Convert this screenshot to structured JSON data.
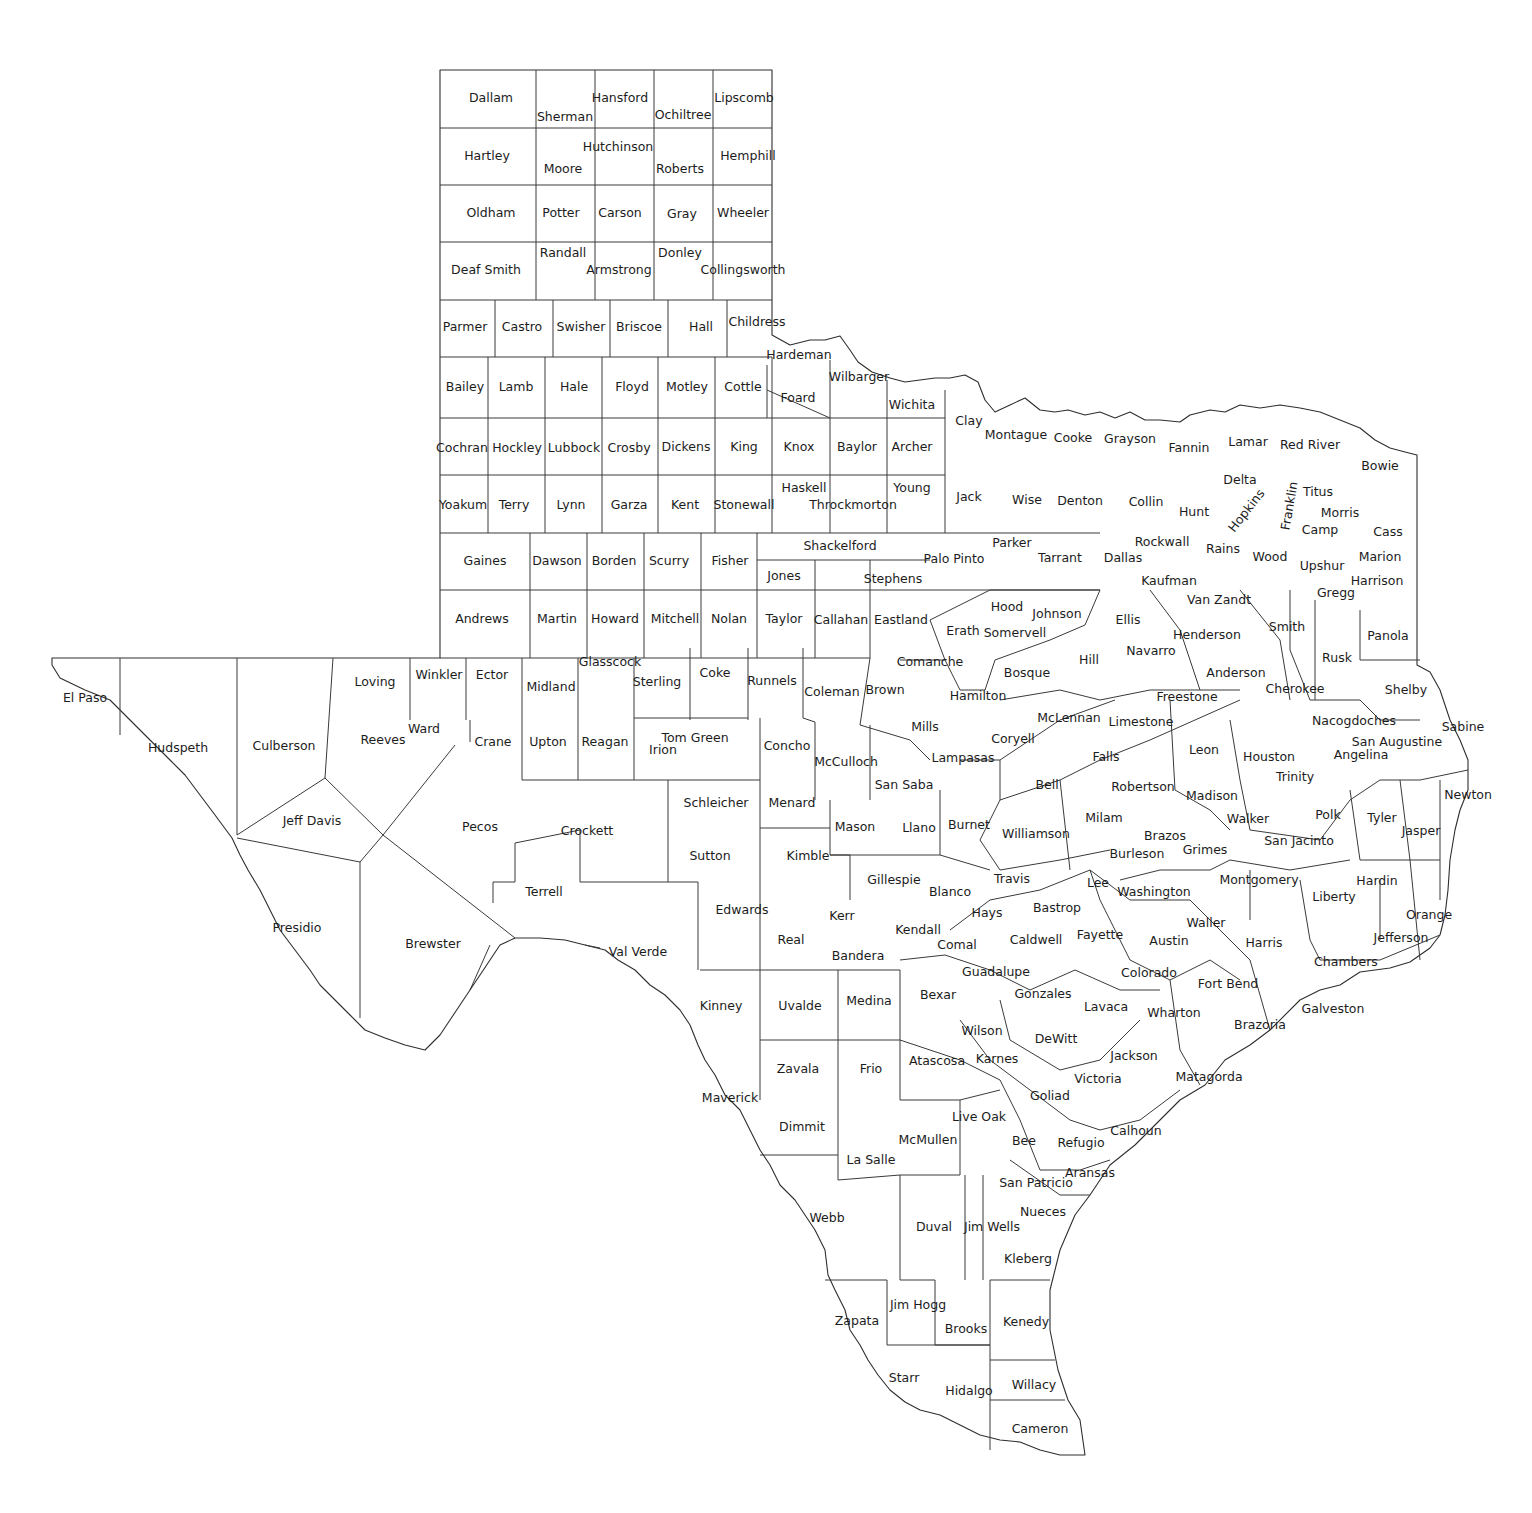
{
  "map": {
    "title": "Texas Counties",
    "stroke_color": "#3a3a3a",
    "label_color": "#1c1c1c",
    "background": "#ffffff"
  },
  "counties": [
    {
      "name": "Dallam",
      "x": 491,
      "y": 98
    },
    {
      "name": "Sherman",
      "x": 565,
      "y": 117
    },
    {
      "name": "Hansford",
      "x": 620,
      "y": 98
    },
    {
      "name": "Ochiltree",
      "x": 683,
      "y": 115
    },
    {
      "name": "Lipscomb",
      "x": 744,
      "y": 98
    },
    {
      "name": "Hartley",
      "x": 487,
      "y": 156
    },
    {
      "name": "Moore",
      "x": 563,
      "y": 169
    },
    {
      "name": "Hutchinson",
      "x": 618,
      "y": 147
    },
    {
      "name": "Roberts",
      "x": 680,
      "y": 169
    },
    {
      "name": "Hemphill",
      "x": 748,
      "y": 156
    },
    {
      "name": "Oldham",
      "x": 491,
      "y": 213
    },
    {
      "name": "Potter",
      "x": 561,
      "y": 213
    },
    {
      "name": "Carson",
      "x": 620,
      "y": 213
    },
    {
      "name": "Gray",
      "x": 682,
      "y": 214
    },
    {
      "name": "Wheeler",
      "x": 743,
      "y": 213
    },
    {
      "name": "Deaf Smith",
      "x": 486,
      "y": 270
    },
    {
      "name": "Randall",
      "x": 563,
      "y": 253
    },
    {
      "name": "Armstrong",
      "x": 619,
      "y": 270
    },
    {
      "name": "Donley",
      "x": 680,
      "y": 253
    },
    {
      "name": "Collingsworth",
      "x": 743,
      "y": 270
    },
    {
      "name": "Parmer",
      "x": 465,
      "y": 327
    },
    {
      "name": "Castro",
      "x": 522,
      "y": 327
    },
    {
      "name": "Swisher",
      "x": 581,
      "y": 327
    },
    {
      "name": "Briscoe",
      "x": 639,
      "y": 327
    },
    {
      "name": "Hall",
      "x": 701,
      "y": 327
    },
    {
      "name": "Childress",
      "x": 757,
      "y": 322
    },
    {
      "name": "Hardeman",
      "x": 799,
      "y": 355
    },
    {
      "name": "Wilbarger",
      "x": 859,
      "y": 377
    },
    {
      "name": "Foard",
      "x": 798,
      "y": 398
    },
    {
      "name": "Wichita",
      "x": 912,
      "y": 405
    },
    {
      "name": "Bailey",
      "x": 465,
      "y": 387
    },
    {
      "name": "Lamb",
      "x": 516,
      "y": 387
    },
    {
      "name": "Hale",
      "x": 574,
      "y": 387
    },
    {
      "name": "Floyd",
      "x": 632,
      "y": 387
    },
    {
      "name": "Motley",
      "x": 687,
      "y": 387
    },
    {
      "name": "Cottle",
      "x": 743,
      "y": 387
    },
    {
      "name": "Cochran",
      "x": 462,
      "y": 448
    },
    {
      "name": "Hockley",
      "x": 517,
      "y": 448
    },
    {
      "name": "Lubbock",
      "x": 574,
      "y": 448
    },
    {
      "name": "Crosby",
      "x": 629,
      "y": 448
    },
    {
      "name": "Dickens",
      "x": 686,
      "y": 447
    },
    {
      "name": "King",
      "x": 744,
      "y": 447
    },
    {
      "name": "Knox",
      "x": 799,
      "y": 447
    },
    {
      "name": "Baylor",
      "x": 857,
      "y": 447
    },
    {
      "name": "Archer",
      "x": 912,
      "y": 447
    },
    {
      "name": "Clay",
      "x": 969,
      "y": 421
    },
    {
      "name": "Montague",
      "x": 1016,
      "y": 435
    },
    {
      "name": "Cooke",
      "x": 1073,
      "y": 438
    },
    {
      "name": "Grayson",
      "x": 1130,
      "y": 439
    },
    {
      "name": "Fannin",
      "x": 1189,
      "y": 448
    },
    {
      "name": "Lamar",
      "x": 1248,
      "y": 442
    },
    {
      "name": "Red River",
      "x": 1310,
      "y": 445
    },
    {
      "name": "Bowie",
      "x": 1380,
      "y": 466
    },
    {
      "name": "Yoakum",
      "x": 463,
      "y": 505
    },
    {
      "name": "Terry",
      "x": 514,
      "y": 505
    },
    {
      "name": "Lynn",
      "x": 571,
      "y": 505
    },
    {
      "name": "Garza",
      "x": 629,
      "y": 505
    },
    {
      "name": "Kent",
      "x": 685,
      "y": 505
    },
    {
      "name": "Stonewall",
      "x": 744,
      "y": 505
    },
    {
      "name": "Haskell",
      "x": 804,
      "y": 488
    },
    {
      "name": "Throckmorton",
      "x": 853,
      "y": 505
    },
    {
      "name": "Young",
      "x": 912,
      "y": 488
    },
    {
      "name": "Jack",
      "x": 969,
      "y": 497
    },
    {
      "name": "Wise",
      "x": 1027,
      "y": 500
    },
    {
      "name": "Denton",
      "x": 1080,
      "y": 501
    },
    {
      "name": "Collin",
      "x": 1146,
      "y": 502
    },
    {
      "name": "Hunt",
      "x": 1194,
      "y": 512
    },
    {
      "name": "Delta",
      "x": 1240,
      "y": 480
    },
    {
      "name": "Titus",
      "x": 1318,
      "y": 492
    },
    {
      "name": "Morris",
      "x": 1340,
      "y": 513
    },
    {
      "name": "Camp",
      "x": 1320,
      "y": 530
    },
    {
      "name": "Cass",
      "x": 1388,
      "y": 532
    },
    {
      "name": "Gaines",
      "x": 485,
      "y": 561
    },
    {
      "name": "Dawson",
      "x": 557,
      "y": 561
    },
    {
      "name": "Borden",
      "x": 614,
      "y": 561
    },
    {
      "name": "Scurry",
      "x": 669,
      "y": 561
    },
    {
      "name": "Fisher",
      "x": 730,
      "y": 561
    },
    {
      "name": "Jones",
      "x": 784,
      "y": 576
    },
    {
      "name": "Shackelford",
      "x": 840,
      "y": 546
    },
    {
      "name": "Stephens",
      "x": 893,
      "y": 579
    },
    {
      "name": "Palo Pinto",
      "x": 954,
      "y": 559
    },
    {
      "name": "Parker",
      "x": 1012,
      "y": 543
    },
    {
      "name": "Tarrant",
      "x": 1060,
      "y": 558
    },
    {
      "name": "Dallas",
      "x": 1123,
      "y": 558
    },
    {
      "name": "Rockwall",
      "x": 1162,
      "y": 542
    },
    {
      "name": "Rains",
      "x": 1223,
      "y": 549
    },
    {
      "name": "Wood",
      "x": 1270,
      "y": 557
    },
    {
      "name": "Upshur",
      "x": 1322,
      "y": 566
    },
    {
      "name": "Marion",
      "x": 1380,
      "y": 557
    },
    {
      "name": "Kaufman",
      "x": 1169,
      "y": 581
    },
    {
      "name": "Van Zandt",
      "x": 1219,
      "y": 600
    },
    {
      "name": "Gregg",
      "x": 1336,
      "y": 593
    },
    {
      "name": "Harrison",
      "x": 1377,
      "y": 581
    },
    {
      "name": "Andrews",
      "x": 482,
      "y": 619
    },
    {
      "name": "Martin",
      "x": 557,
      "y": 619
    },
    {
      "name": "Howard",
      "x": 615,
      "y": 619
    },
    {
      "name": "Mitchell",
      "x": 675,
      "y": 619
    },
    {
      "name": "Nolan",
      "x": 729,
      "y": 619
    },
    {
      "name": "Taylor",
      "x": 784,
      "y": 619
    },
    {
      "name": "Callahan",
      "x": 841,
      "y": 620
    },
    {
      "name": "Eastland",
      "x": 901,
      "y": 620
    },
    {
      "name": "Erath",
      "x": 963,
      "y": 631
    },
    {
      "name": "Hood",
      "x": 1007,
      "y": 607
    },
    {
      "name": "Somervell",
      "x": 1015,
      "y": 633
    },
    {
      "name": "Johnson",
      "x": 1057,
      "y": 614
    },
    {
      "name": "Ellis",
      "x": 1128,
      "y": 620
    },
    {
      "name": "Henderson",
      "x": 1207,
      "y": 635
    },
    {
      "name": "Smith",
      "x": 1287,
      "y": 627
    },
    {
      "name": "Panola",
      "x": 1388,
      "y": 636
    },
    {
      "name": "El Paso",
      "x": 85,
      "y": 698
    },
    {
      "name": "Hudspeth",
      "x": 178,
      "y": 748
    },
    {
      "name": "Culberson",
      "x": 284,
      "y": 746
    },
    {
      "name": "Loving",
      "x": 375,
      "y": 682
    },
    {
      "name": "Winkler",
      "x": 439,
      "y": 675
    },
    {
      "name": "Ector",
      "x": 492,
      "y": 675
    },
    {
      "name": "Midland",
      "x": 551,
      "y": 687
    },
    {
      "name": "Glasscock",
      "x": 610,
      "y": 662
    },
    {
      "name": "Sterling",
      "x": 657,
      "y": 682
    },
    {
      "name": "Coke",
      "x": 715,
      "y": 673
    },
    {
      "name": "Runnels",
      "x": 772,
      "y": 681
    },
    {
      "name": "Coleman",
      "x": 832,
      "y": 692
    },
    {
      "name": "Brown",
      "x": 885,
      "y": 690
    },
    {
      "name": "Comanche",
      "x": 930,
      "y": 662
    },
    {
      "name": "Bosque",
      "x": 1027,
      "y": 673
    },
    {
      "name": "Hill",
      "x": 1089,
      "y": 660
    },
    {
      "name": "Navarro",
      "x": 1151,
      "y": 651
    },
    {
      "name": "Anderson",
      "x": 1236,
      "y": 673
    },
    {
      "name": "Cherokee",
      "x": 1295,
      "y": 689
    },
    {
      "name": "Rusk",
      "x": 1337,
      "y": 658
    },
    {
      "name": "Shelby",
      "x": 1406,
      "y": 690
    },
    {
      "name": "Reeves",
      "x": 383,
      "y": 740
    },
    {
      "name": "Ward",
      "x": 424,
      "y": 729
    },
    {
      "name": "Crane",
      "x": 493,
      "y": 742
    },
    {
      "name": "Upton",
      "x": 548,
      "y": 742
    },
    {
      "name": "Reagan",
      "x": 605,
      "y": 742
    },
    {
      "name": "Irion",
      "x": 663,
      "y": 750
    },
    {
      "name": "Tom Green",
      "x": 695,
      "y": 738
    },
    {
      "name": "Concho",
      "x": 787,
      "y": 746
    },
    {
      "name": "McCulloch",
      "x": 846,
      "y": 762
    },
    {
      "name": "Mills",
      "x": 925,
      "y": 727
    },
    {
      "name": "Hamilton",
      "x": 978,
      "y": 696
    },
    {
      "name": "Coryell",
      "x": 1013,
      "y": 739
    },
    {
      "name": "McLennan",
      "x": 1069,
      "y": 718
    },
    {
      "name": "Limestone",
      "x": 1141,
      "y": 722
    },
    {
      "name": "Freestone",
      "x": 1187,
      "y": 697
    },
    {
      "name": "Leon",
      "x": 1204,
      "y": 750
    },
    {
      "name": "Houston",
      "x": 1269,
      "y": 757
    },
    {
      "name": "Trinity",
      "x": 1295,
      "y": 777
    },
    {
      "name": "Nacogdoches",
      "x": 1354,
      "y": 721
    },
    {
      "name": "San Augustine",
      "x": 1397,
      "y": 742
    },
    {
      "name": "Angelina",
      "x": 1361,
      "y": 755
    },
    {
      "name": "Sabine",
      "x": 1463,
      "y": 727
    },
    {
      "name": "Lampasas",
      "x": 963,
      "y": 758
    },
    {
      "name": "Bell",
      "x": 1047,
      "y": 785
    },
    {
      "name": "Falls",
      "x": 1106,
      "y": 757
    },
    {
      "name": "Robertson",
      "x": 1143,
      "y": 787
    },
    {
      "name": "Madison",
      "x": 1212,
      "y": 796
    },
    {
      "name": "Polk",
      "x": 1328,
      "y": 815
    },
    {
      "name": "Tyler",
      "x": 1382,
      "y": 818
    },
    {
      "name": "Jasper",
      "x": 1421,
      "y": 831
    },
    {
      "name": "Newton",
      "x": 1468,
      "y": 795
    },
    {
      "name": "Jeff Davis",
      "x": 312,
      "y": 821
    },
    {
      "name": "Pecos",
      "x": 480,
      "y": 827
    },
    {
      "name": "Crockett",
      "x": 587,
      "y": 831
    },
    {
      "name": "Schleicher",
      "x": 716,
      "y": 803
    },
    {
      "name": "Menard",
      "x": 792,
      "y": 803
    },
    {
      "name": "San Saba",
      "x": 904,
      "y": 785
    },
    {
      "name": "Mason",
      "x": 855,
      "y": 827
    },
    {
      "name": "Llano",
      "x": 919,
      "y": 828
    },
    {
      "name": "Burnet",
      "x": 969,
      "y": 825
    },
    {
      "name": "Williamson",
      "x": 1036,
      "y": 834
    },
    {
      "name": "Milam",
      "x": 1104,
      "y": 818
    },
    {
      "name": "Brazos",
      "x": 1165,
      "y": 836
    },
    {
      "name": "Walker",
      "x": 1248,
      "y": 819
    },
    {
      "name": "San Jacinto",
      "x": 1299,
      "y": 841
    },
    {
      "name": "Grimes",
      "x": 1205,
      "y": 850
    },
    {
      "name": "Burleson",
      "x": 1137,
      "y": 854
    },
    {
      "name": "Sutton",
      "x": 710,
      "y": 856
    },
    {
      "name": "Kimble",
      "x": 808,
      "y": 856
    },
    {
      "name": "Gillespie",
      "x": 894,
      "y": 880
    },
    {
      "name": "Blanco",
      "x": 950,
      "y": 892
    },
    {
      "name": "Travis",
      "x": 1012,
      "y": 879
    },
    {
      "name": "Lee",
      "x": 1098,
      "y": 883
    },
    {
      "name": "Washington",
      "x": 1154,
      "y": 892
    },
    {
      "name": "Montgomery",
      "x": 1259,
      "y": 880
    },
    {
      "name": "Liberty",
      "x": 1334,
      "y": 897
    },
    {
      "name": "Hardin",
      "x": 1377,
      "y": 881
    },
    {
      "name": "Orange",
      "x": 1429,
      "y": 915
    },
    {
      "name": "Terrell",
      "x": 544,
      "y": 892
    },
    {
      "name": "Presidio",
      "x": 297,
      "y": 928
    },
    {
      "name": "Brewster",
      "x": 433,
      "y": 944
    },
    {
      "name": "Val Verde",
      "x": 638,
      "y": 952
    },
    {
      "name": "Edwards",
      "x": 742,
      "y": 910
    },
    {
      "name": "Kerr",
      "x": 842,
      "y": 916
    },
    {
      "name": "Kendall",
      "x": 918,
      "y": 930
    },
    {
      "name": "Hays",
      "x": 987,
      "y": 913
    },
    {
      "name": "Bastrop",
      "x": 1057,
      "y": 908
    },
    {
      "name": "Caldwell",
      "x": 1036,
      "y": 940
    },
    {
      "name": "Fayette",
      "x": 1100,
      "y": 935
    },
    {
      "name": "Austin",
      "x": 1169,
      "y": 941
    },
    {
      "name": "Waller",
      "x": 1206,
      "y": 923
    },
    {
      "name": "Harris",
      "x": 1264,
      "y": 943
    },
    {
      "name": "Jefferson",
      "x": 1401,
      "y": 938
    },
    {
      "name": "Chambers",
      "x": 1346,
      "y": 962
    },
    {
      "name": "Real",
      "x": 791,
      "y": 940
    },
    {
      "name": "Bandera",
      "x": 858,
      "y": 956
    },
    {
      "name": "Comal",
      "x": 957,
      "y": 945
    },
    {
      "name": "Guadalupe",
      "x": 996,
      "y": 972
    },
    {
      "name": "Colorado",
      "x": 1149,
      "y": 973
    },
    {
      "name": "Fort Bend",
      "x": 1228,
      "y": 984
    },
    {
      "name": "Galveston",
      "x": 1333,
      "y": 1009
    },
    {
      "name": "Brazoria",
      "x": 1260,
      "y": 1025
    },
    {
      "name": "Kinney",
      "x": 721,
      "y": 1006
    },
    {
      "name": "Uvalde",
      "x": 800,
      "y": 1006
    },
    {
      "name": "Medina",
      "x": 869,
      "y": 1001
    },
    {
      "name": "Bexar",
      "x": 938,
      "y": 995
    },
    {
      "name": "Gonzales",
      "x": 1043,
      "y": 994
    },
    {
      "name": "Lavaca",
      "x": 1106,
      "y": 1007
    },
    {
      "name": "Wharton",
      "x": 1174,
      "y": 1013
    },
    {
      "name": "Wilson",
      "x": 982,
      "y": 1031
    },
    {
      "name": "DeWitt",
      "x": 1056,
      "y": 1039
    },
    {
      "name": "Jackson",
      "x": 1134,
      "y": 1056
    },
    {
      "name": "Matagorda",
      "x": 1209,
      "y": 1077
    },
    {
      "name": "Zavala",
      "x": 798,
      "y": 1069
    },
    {
      "name": "Frio",
      "x": 871,
      "y": 1069
    },
    {
      "name": "Atascosa",
      "x": 937,
      "y": 1061
    },
    {
      "name": "Karnes",
      "x": 997,
      "y": 1059
    },
    {
      "name": "Victoria",
      "x": 1098,
      "y": 1079
    },
    {
      "name": "Goliad",
      "x": 1050,
      "y": 1096
    },
    {
      "name": "Maverick",
      "x": 730,
      "y": 1098
    },
    {
      "name": "Dimmit",
      "x": 802,
      "y": 1127
    },
    {
      "name": "Live Oak",
      "x": 979,
      "y": 1117
    },
    {
      "name": "McMullen",
      "x": 928,
      "y": 1140
    },
    {
      "name": "Bee",
      "x": 1024,
      "y": 1141
    },
    {
      "name": "Refugio",
      "x": 1081,
      "y": 1143
    },
    {
      "name": "Calhoun",
      "x": 1136,
      "y": 1131
    },
    {
      "name": "La Salle",
      "x": 871,
      "y": 1160
    },
    {
      "name": "Aransas",
      "x": 1090,
      "y": 1173
    },
    {
      "name": "San Patricio",
      "x": 1036,
      "y": 1183
    },
    {
      "name": "Nueces",
      "x": 1043,
      "y": 1212
    },
    {
      "name": "Webb",
      "x": 827,
      "y": 1218
    },
    {
      "name": "Duval",
      "x": 934,
      "y": 1227
    },
    {
      "name": "Jim Wells",
      "x": 992,
      "y": 1227
    },
    {
      "name": "Kleberg",
      "x": 1028,
      "y": 1259
    },
    {
      "name": "Jim Hogg",
      "x": 918,
      "y": 1305
    },
    {
      "name": "Zapata",
      "x": 857,
      "y": 1321
    },
    {
      "name": "Brooks",
      "x": 966,
      "y": 1329
    },
    {
      "name": "Kenedy",
      "x": 1026,
      "y": 1322
    },
    {
      "name": "Starr",
      "x": 904,
      "y": 1378
    },
    {
      "name": "Hidalgo",
      "x": 969,
      "y": 1391
    },
    {
      "name": "Willacy",
      "x": 1034,
      "y": 1385
    },
    {
      "name": "Cameron",
      "x": 1040,
      "y": 1429
    }
  ],
  "rotated_labels": [
    {
      "name": "Hopkins",
      "x": 1247,
      "y": 511,
      "angle": -52
    },
    {
      "name": "Franklin",
      "x": 1290,
      "y": 506,
      "angle": -80
    }
  ]
}
